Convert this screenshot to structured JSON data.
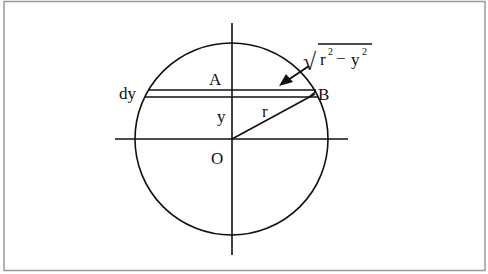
{
  "diagram": {
    "type": "geometry",
    "labels": {
      "A": "A",
      "B": "B",
      "O": "O",
      "r": "r",
      "y": "y",
      "dy": "dy",
      "half_chord": {
        "radical": "√",
        "r_base": "r",
        "r_exp": "2",
        "minus": "−",
        "y_base": "y",
        "y_exp": "2"
      }
    },
    "colors": {
      "stroke": "#111111",
      "frame": "#9a9a9a",
      "background": "#ffffff"
    }
  }
}
